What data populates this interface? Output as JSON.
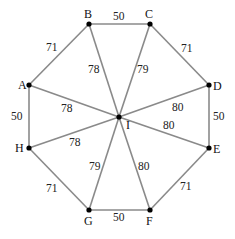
{
  "diagram": {
    "type": "weighted-graph",
    "colors": {
      "edge": "#8a8a8a",
      "node": "#000000",
      "text": "#111111",
      "background": "#ffffff"
    },
    "nodes": [
      {
        "id": "A",
        "label": "A",
        "x": 29,
        "y": 85,
        "lx": 18,
        "ly": 89
      },
      {
        "id": "B",
        "label": "B",
        "x": 89,
        "y": 24,
        "lx": 84,
        "ly": 18
      },
      {
        "id": "C",
        "label": "C",
        "x": 150,
        "y": 24,
        "lx": 145,
        "ly": 18
      },
      {
        "id": "D",
        "label": "D",
        "x": 209,
        "y": 85,
        "lx": 213,
        "ly": 90
      },
      {
        "id": "E",
        "label": "E",
        "x": 209,
        "y": 148,
        "lx": 213,
        "ly": 153
      },
      {
        "id": "F",
        "label": "F",
        "x": 150,
        "y": 210,
        "lx": 146,
        "ly": 225
      },
      {
        "id": "G",
        "label": "G",
        "x": 89,
        "y": 210,
        "lx": 84,
        "ly": 225
      },
      {
        "id": "H",
        "label": "H",
        "x": 29,
        "y": 148,
        "lx": 15,
        "ly": 152
      },
      {
        "id": "I",
        "label": "I",
        "x": 119,
        "y": 117,
        "lx": 126,
        "ly": 129
      }
    ],
    "edges": [
      {
        "from": "A",
        "to": "B",
        "weight": "71",
        "lx": 46,
        "ly": 51
      },
      {
        "from": "B",
        "to": "C",
        "weight": "50",
        "lx": 113,
        "ly": 20
      },
      {
        "from": "C",
        "to": "D",
        "weight": "71",
        "lx": 181,
        "ly": 52
      },
      {
        "from": "D",
        "to": "E",
        "weight": "50",
        "lx": 213,
        "ly": 120
      },
      {
        "from": "E",
        "to": "F",
        "weight": "71",
        "lx": 180,
        "ly": 190
      },
      {
        "from": "F",
        "to": "G",
        "weight": "50",
        "lx": 113,
        "ly": 221
      },
      {
        "from": "G",
        "to": "H",
        "weight": "71",
        "lx": 46,
        "ly": 192
      },
      {
        "from": "H",
        "to": "A",
        "weight": "50",
        "lx": 11,
        "ly": 120
      },
      {
        "from": "A",
        "to": "I",
        "weight": "78",
        "lx": 61,
        "ly": 112
      },
      {
        "from": "B",
        "to": "I",
        "weight": "78",
        "lx": 88,
        "ly": 73
      },
      {
        "from": "C",
        "to": "I",
        "weight": "79",
        "lx": 137,
        "ly": 73
      },
      {
        "from": "D",
        "to": "I",
        "weight": "80",
        "lx": 172,
        "ly": 111
      },
      {
        "from": "E",
        "to": "I",
        "weight": "80",
        "lx": 163,
        "ly": 129
      },
      {
        "from": "F",
        "to": "I",
        "weight": "80",
        "lx": 138,
        "ly": 170
      },
      {
        "from": "G",
        "to": "I",
        "weight": "79",
        "lx": 89,
        "ly": 170
      },
      {
        "from": "H",
        "to": "I",
        "weight": "78",
        "lx": 69,
        "ly": 146
      }
    ]
  }
}
